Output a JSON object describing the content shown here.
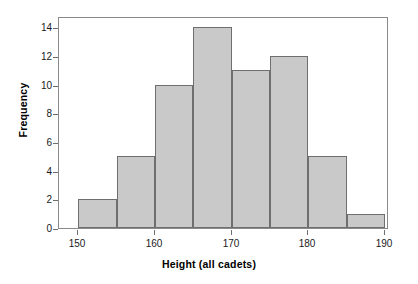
{
  "chart_data": {
    "type": "bar",
    "title": "",
    "subtitle": "",
    "xlabel": "Height (all cadets)",
    "ylabel": "Frequency",
    "xlim": [
      147.5,
      190.5
    ],
    "ylim": [
      0,
      14.8
    ],
    "grid": false,
    "legend": null,
    "bin_width": 5,
    "bin_edges": [
      150,
      155,
      160,
      165,
      170,
      175,
      180,
      185,
      190
    ],
    "categories": [
      "150-155",
      "155-160",
      "160-165",
      "165-170",
      "170-175",
      "175-180",
      "180-185",
      "185-190"
    ],
    "values": [
      2,
      5,
      10,
      14,
      11,
      12,
      5,
      1
    ],
    "bars": [
      {
        "label": "150-155",
        "start": 150,
        "end": 155,
        "value": 2
      },
      {
        "label": "155-160",
        "start": 155,
        "end": 160,
        "value": 5
      },
      {
        "label": "160-165",
        "start": 160,
        "end": 165,
        "value": 10
      },
      {
        "label": "165-170",
        "start": 165,
        "end": 170,
        "value": 14
      },
      {
        "label": "170-175",
        "start": 170,
        "end": 175,
        "value": 11
      },
      {
        "label": "175-180",
        "start": 175,
        "end": 180,
        "value": 12
      },
      {
        "label": "180-185",
        "start": 180,
        "end": 185,
        "value": 5
      },
      {
        "label": "185-190",
        "start": 185,
        "end": 190,
        "value": 1
      }
    ],
    "x_ticks": [
      150,
      160,
      170,
      180,
      190
    ],
    "x_tick_labels": [
      "150",
      "160",
      "170",
      "180",
      "190"
    ],
    "y_ticks": [
      0,
      2,
      4,
      6,
      8,
      10,
      12,
      14
    ],
    "y_tick_labels": [
      "0",
      "2",
      "4",
      "6",
      "8",
      "10",
      "12",
      "14"
    ],
    "colors": {
      "bar_fill": "#c9c9c9",
      "bar_edge": "#6f6f6f",
      "axis": "#6e6e6e",
      "text": "#000000",
      "background": "#ffffff"
    }
  }
}
